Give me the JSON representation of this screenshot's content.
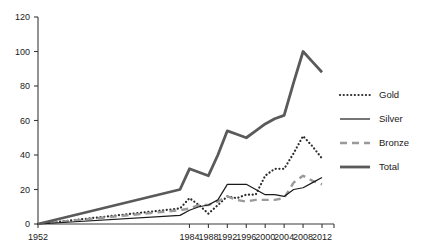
{
  "chart_data": {
    "type": "line",
    "title": "",
    "subtitle": "",
    "xlabel": "",
    "ylabel": "",
    "xlim": [
      1952,
      2012
    ],
    "ylim": [
      0,
      120
    ],
    "grid": false,
    "legend_position": "right",
    "x_tick_labels": [
      "1952",
      "1984",
      "1988",
      "1992",
      "1996",
      "2000",
      "2004",
      "2008",
      "2012"
    ],
    "x_tick_values": [
      1952,
      1984,
      1988,
      1992,
      1996,
      2000,
      2004,
      2008,
      2012
    ],
    "y_tick_labels": [
      "0",
      "20",
      "40",
      "60",
      "80",
      "100",
      "120"
    ],
    "y_tick_values": [
      0,
      20,
      40,
      60,
      80,
      100,
      120
    ],
    "x": [
      1952,
      1982,
      1984,
      1986,
      1988,
      1990,
      1992,
      1994,
      1996,
      1998,
      2000,
      2002,
      2004,
      2006,
      2008,
      2010,
      2012
    ],
    "series": [
      {
        "name": "Gold",
        "style": "dotted",
        "color": "#2b2b2b",
        "values": [
          0,
          9,
          15,
          11,
          6,
          11,
          16,
          15,
          17,
          17,
          28,
          32,
          32,
          41,
          51,
          45,
          38
        ]
      },
      {
        "name": "Silver",
        "style": "solid-thin",
        "color": "#1a1a1a",
        "values": [
          0,
          5,
          8,
          10,
          11,
          14,
          23,
          23,
          23,
          20,
          17,
          17,
          16,
          20,
          21,
          24,
          27
        ]
      },
      {
        "name": "Bronze",
        "style": "dashed",
        "color": "#9a9a9a",
        "values": [
          0,
          8,
          9,
          11,
          11,
          13,
          16,
          14,
          13,
          14,
          14,
          14,
          15,
          24,
          28,
          25,
          23
        ]
      },
      {
        "name": "Total",
        "style": "solid-thick",
        "color": "#5a5a5a",
        "values": [
          0,
          20,
          32,
          30,
          28,
          40,
          54,
          52,
          50,
          54,
          58,
          61,
          63,
          82,
          100,
          94,
          88
        ]
      }
    ]
  },
  "legend": {
    "items": [
      {
        "label": "Gold"
      },
      {
        "label": "Silver"
      },
      {
        "label": "Bronze"
      },
      {
        "label": "Total"
      }
    ]
  }
}
